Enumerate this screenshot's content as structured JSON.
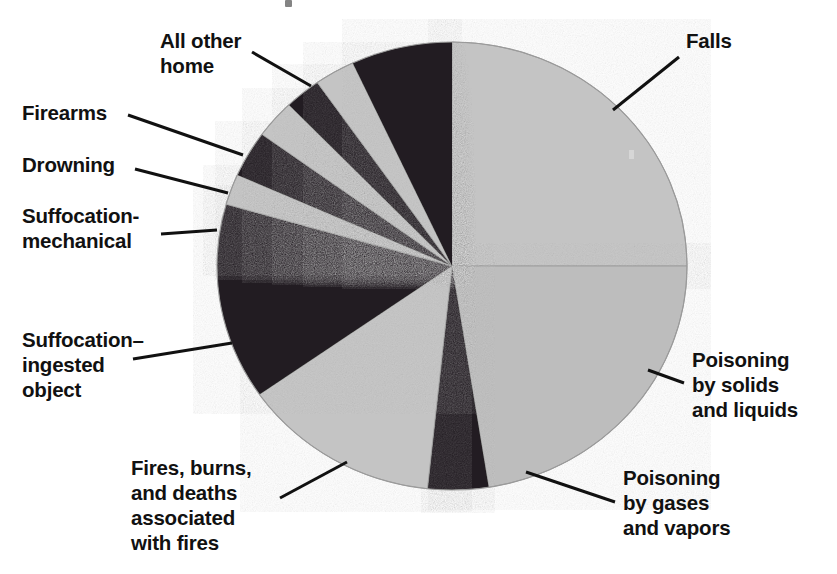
{
  "figure": {
    "width": 837,
    "height": 574,
    "background": "#ffffff"
  },
  "chart_data": {
    "type": "pie",
    "title": "",
    "subtitle": "",
    "xlabel": "",
    "ylabel": "",
    "grid": false,
    "legend_position": "none",
    "label_style": "leader-lines to outside labels",
    "center": {
      "x": 452,
      "y": 266
    },
    "radius_x": 235,
    "radius_y": 224,
    "start_angle_deg": 0,
    "direction": "clockwise",
    "colors": {
      "light": "#c4c4c4",
      "light_alt": "#bdbdbd",
      "dark": "#231f20",
      "outline": "#9a9a9a",
      "leader": "#111111",
      "text": "#111111"
    },
    "categories": [
      "Falls",
      "Poisoning by solids and liquids",
      "Poisoning by gases and vapors",
      "Fires, burns, and deaths associated with fires",
      "Suffocation–ingested object",
      "Suffocation-mechanical",
      "Drowning",
      "Firearms",
      "All other home"
    ],
    "values": [
      25.0,
      22.5,
      4.2,
      13.6,
      14.2,
      2.2,
      3.3,
      2.8,
      12.2
    ],
    "slices": [
      {
        "label": "Falls",
        "percent": 25.0,
        "start_deg": 0.0,
        "end_deg": 90.0,
        "shade": "light"
      },
      {
        "label": "Poisoning by solids and liquids",
        "percent": 22.5,
        "start_deg": 90.0,
        "end_deg": 171.0,
        "shade": "light_alt"
      },
      {
        "label": "Poisoning by gases and vapors",
        "percent": 4.2,
        "start_deg": 171.0,
        "end_deg": 186.0,
        "shade": "dark"
      },
      {
        "label": "Fires, burns, and deaths associated with fires",
        "percent": 13.6,
        "start_deg": 186.0,
        "end_deg": 235.0,
        "shade": "light"
      },
      {
        "label": "Suffocation–ingested object",
        "percent": 14.2,
        "start_deg": 235.0,
        "end_deg": 286.0,
        "shade": "dark"
      },
      {
        "label": "Suffocation-mechanical",
        "percent": 2.2,
        "start_deg": 286.0,
        "end_deg": 294.0,
        "shade": "light"
      },
      {
        "label": "Drowning-dark-band",
        "percent": 3.3,
        "start_deg": 294.0,
        "end_deg": 306.0,
        "shade": "dark"
      },
      {
        "label": "Drowning",
        "percent": 2.8,
        "start_deg": 306.0,
        "end_deg": 316.0,
        "shade": "light"
      },
      {
        "label": "Firearms-dark-band",
        "percent": 2.5,
        "start_deg": 316.0,
        "end_deg": 325.0,
        "shade": "dark"
      },
      {
        "label": "Firearms",
        "percent": 2.8,
        "start_deg": 325.0,
        "end_deg": 335.0,
        "shade": "light"
      },
      {
        "label": "All other home",
        "percent": 12.2,
        "start_deg": 335.0,
        "end_deg": 360.0,
        "shade": "dark"
      }
    ]
  },
  "labels": {
    "falls": {
      "text": "Falls",
      "x": 686,
      "y": 28,
      "leader": {
        "x1": 679,
        "y1": 57,
        "x2": 613,
        "y2": 110
      }
    },
    "poisoning_solids": {
      "text": "Poisoning\nby solids\nand liquids",
      "x": 692,
      "y": 347,
      "leader": {
        "x1": 684,
        "y1": 383,
        "x2": 648,
        "y2": 370
      }
    },
    "poisoning_gases": {
      "text": "Poisoning\nby gases\nand vapors",
      "x": 623,
      "y": 465,
      "leader": {
        "x1": 615,
        "y1": 502,
        "x2": 526,
        "y2": 472
      }
    },
    "fires_burns": {
      "text": "Fires, burns,\nand deaths\nassociated\nwith fires",
      "x": 131,
      "y": 455,
      "leader": {
        "x1": 280,
        "y1": 498,
        "x2": 347,
        "y2": 462
      }
    },
    "suffocation_ingested": {
      "text": "Suffocation–\ningested\nobject",
      "x": 22,
      "y": 327,
      "leader": {
        "x1": 133,
        "y1": 359,
        "x2": 232,
        "y2": 343
      }
    },
    "suffocation_mechanical": {
      "text": "Suffocation-\nmechanical",
      "x": 22,
      "y": 203,
      "leader": {
        "x1": 161,
        "y1": 234,
        "x2": 217,
        "y2": 230
      }
    },
    "drowning": {
      "text": "Drowning",
      "x": 22,
      "y": 152,
      "leader": {
        "x1": 135,
        "y1": 169,
        "x2": 228,
        "y2": 193
      }
    },
    "firearms": {
      "text": "Firearms",
      "x": 22,
      "y": 100,
      "leader": {
        "x1": 128,
        "y1": 115,
        "x2": 243,
        "y2": 155
      }
    },
    "all_other_home": {
      "text": "All other\nhome",
      "x": 160,
      "y": 28,
      "leader": {
        "x1": 252,
        "y1": 52,
        "x2": 311,
        "y2": 86
      }
    }
  }
}
